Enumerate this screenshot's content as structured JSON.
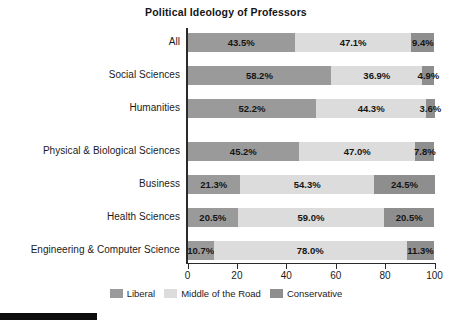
{
  "chart_data": {
    "type": "bar",
    "orientation": "horizontal",
    "stacked": true,
    "title": "Political Ideology of Professors",
    "xlabel": "",
    "ylabel": "",
    "xlim": [
      0,
      100
    ],
    "xticks": [
      0,
      20,
      40,
      60,
      80,
      100
    ],
    "xtick_labels": [
      "0",
      "20",
      "40",
      "60",
      "80",
      "100"
    ],
    "grid": false,
    "legend_position": "bottom-center",
    "categories": [
      "All",
      "Social Sciences",
      "Humanities",
      "Physical & Biological Sciences",
      "Business",
      "Health Sciences",
      "Engineering & Computer Science"
    ],
    "series": [
      {
        "name": "Liberal",
        "color": "#9a9a9a",
        "values": [
          43.5,
          58.2,
          52.2,
          45.2,
          21.3,
          20.5,
          10.7
        ],
        "labels": [
          "43.5%",
          "58.2%",
          "52.2%",
          "45.2%",
          "21.3%",
          "20.5%",
          "10.7%"
        ]
      },
      {
        "name": "Middle of the Road",
        "color": "#dcdcdc",
        "values": [
          47.1,
          36.9,
          44.3,
          47.0,
          54.3,
          59.0,
          78.0
        ],
        "labels": [
          "47.1%",
          "36.9%",
          "44.3%",
          "47.0%",
          "54.3%",
          "59.0%",
          "78.0%"
        ]
      },
      {
        "name": "Conservative",
        "color": "#8e8e8e",
        "values": [
          9.4,
          4.9,
          3.6,
          7.8,
          24.5,
          20.5,
          11.3
        ],
        "labels": [
          "9.4%",
          "4.9%",
          "3.6%",
          "7.8%",
          "24.5%",
          "20.5%",
          "11.3%"
        ]
      }
    ]
  },
  "legend": {
    "items": [
      {
        "label": "Liberal",
        "color": "#9a9a9a"
      },
      {
        "label": "Middle of the Road",
        "color": "#dcdcdc"
      },
      {
        "label": "Conservative",
        "color": "#8e8e8e"
      }
    ]
  }
}
